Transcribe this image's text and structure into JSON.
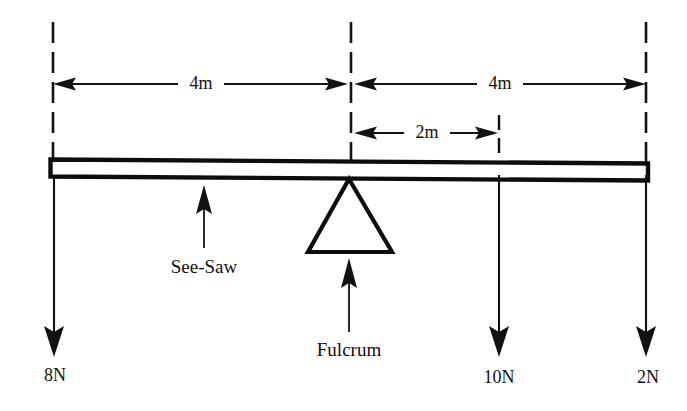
{
  "diagram": {
    "type": "physics-free-body-diagram",
    "background_color": "#ffffff",
    "ink_color": "#111111",
    "beam": {
      "name_label": "See-Saw",
      "left_end_x": 50,
      "right_end_x": 648
    },
    "fulcrum": {
      "name_label": "Fulcrum",
      "position_x": 349
    },
    "dimensions": [
      {
        "id": "left-span",
        "label": "4m",
        "from_x": 53,
        "to_x": 348,
        "y": 84,
        "arrows": "both"
      },
      {
        "id": "right-span",
        "label": "4m",
        "from_x": 354,
        "to_x": 645,
        "y": 84,
        "arrows": "both"
      },
      {
        "id": "inner-span",
        "label": "2m",
        "from_x": 354,
        "to_x": 498,
        "y": 133,
        "arrows": "both"
      }
    ],
    "forces": [
      {
        "id": "force-left",
        "label": "8N",
        "x": 54,
        "direction": "down",
        "from_y": 178,
        "to_y": 356,
        "label_y": 378
      },
      {
        "id": "force-mid-right",
        "label": "10N",
        "x": 499,
        "direction": "down",
        "from_y": 175,
        "to_y": 356,
        "label_y": 380
      },
      {
        "id": "force-right",
        "label": "2N",
        "x": 646,
        "direction": "down",
        "from_y": 175,
        "to_y": 356,
        "label_y": 380
      }
    ],
    "guides": [
      {
        "id": "guide-left",
        "x": 53,
        "top_y": 22,
        "bottom_y": 176
      },
      {
        "id": "guide-center",
        "x": 351,
        "top_y": 22,
        "bottom_y": 168
      },
      {
        "id": "guide-right",
        "x": 646,
        "top_y": 22,
        "bottom_y": 172
      },
      {
        "id": "guide-inner",
        "x": 499,
        "top_y": 115,
        "bottom_y": 166
      }
    ],
    "callouts": [
      {
        "id": "see-saw-callout",
        "label": "See-Saw",
        "arrow_x": 204,
        "arrow_from_y": 248,
        "arrow_to_y": 186,
        "label_x": 204,
        "label_y": 272
      },
      {
        "id": "fulcrum-callout",
        "label": "Fulcrum",
        "arrow_x": 349,
        "arrow_from_y": 332,
        "arrow_to_y": 258,
        "label_x": 349,
        "label_y": 354
      }
    ]
  }
}
